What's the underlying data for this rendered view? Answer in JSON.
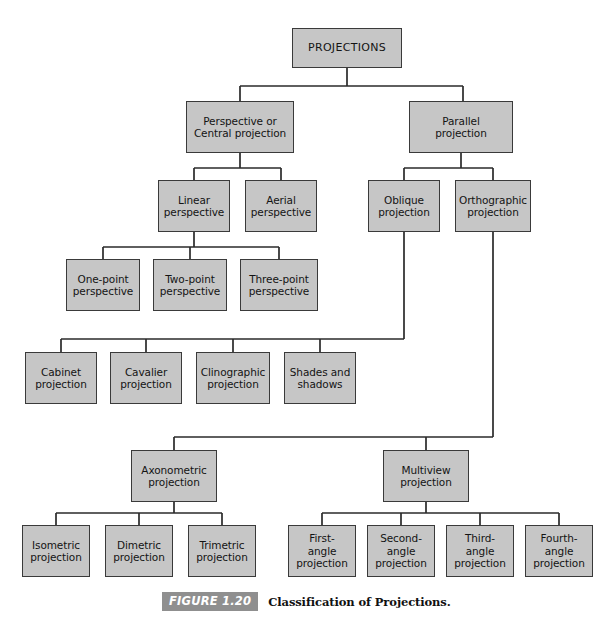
{
  "figure": {
    "label": "FIGURE 1.20",
    "caption": "Classification of Projections."
  },
  "diagram": {
    "type": "tree",
    "title": "Classification of Projections",
    "box_fill_color": "#c6c6c6",
    "box_border_color": "#3a3a3a",
    "line_color": "#2b2b2b",
    "background_color": "#ffffff",
    "levels": 6,
    "nodes": [
      {
        "id": "projections",
        "label": "PROJECTIONS",
        "level": 0,
        "parent": null,
        "x": 292,
        "y": 28,
        "w": 110,
        "h": 40
      },
      {
        "id": "perspective-central",
        "label": "Perspective or\nCentral projection",
        "level": 1,
        "parent": "projections",
        "x": 186,
        "y": 101,
        "w": 108,
        "h": 52
      },
      {
        "id": "parallel",
        "label": "Parallel\nprojection",
        "level": 1,
        "parent": "projections",
        "x": 409,
        "y": 101,
        "w": 104,
        "h": 52
      },
      {
        "id": "linear-perspective",
        "label": "Linear\nperspective",
        "level": 2,
        "parent": "perspective-central",
        "x": 158,
        "y": 180,
        "w": 72,
        "h": 52
      },
      {
        "id": "aerial-perspective",
        "label": "Aerial\nperspective",
        "level": 2,
        "parent": "perspective-central",
        "x": 245,
        "y": 180,
        "w": 72,
        "h": 52
      },
      {
        "id": "oblique",
        "label": "Oblique\nprojection",
        "level": 2,
        "parent": "parallel",
        "x": 368,
        "y": 180,
        "w": 72,
        "h": 52
      },
      {
        "id": "orthographic",
        "label": "Orthographic\nprojection",
        "level": 2,
        "parent": "parallel",
        "x": 455,
        "y": 180,
        "w": 76,
        "h": 52
      },
      {
        "id": "one-point",
        "label": "One-point\nperspective",
        "level": 3,
        "parent": "linear-perspective",
        "x": 66,
        "y": 259,
        "w": 74,
        "h": 52
      },
      {
        "id": "two-point",
        "label": "Two-point\nperspective",
        "level": 3,
        "parent": "linear-perspective",
        "x": 153,
        "y": 259,
        "w": 74,
        "h": 52
      },
      {
        "id": "three-point",
        "label": "Three-point\nperspective",
        "level": 3,
        "parent": "linear-perspective",
        "x": 240,
        "y": 259,
        "w": 78,
        "h": 52
      },
      {
        "id": "cabinet",
        "label": "Cabinet\nprojection",
        "level": 3,
        "parent": "oblique",
        "x": 25,
        "y": 352,
        "w": 72,
        "h": 52
      },
      {
        "id": "cavalier",
        "label": "Cavalier\nprojection",
        "level": 3,
        "parent": "oblique",
        "x": 110,
        "y": 352,
        "w": 72,
        "h": 52
      },
      {
        "id": "clinographic",
        "label": "Clinographic\nprojection",
        "level": 3,
        "parent": "oblique",
        "x": 196,
        "y": 352,
        "w": 74,
        "h": 52
      },
      {
        "id": "shades-shadows",
        "label": "Shades and\nshadows",
        "level": 3,
        "parent": "oblique",
        "x": 284,
        "y": 352,
        "w": 72,
        "h": 52
      },
      {
        "id": "axonometric",
        "label": "Axonometric\nprojection",
        "level": 3,
        "parent": "orthographic",
        "x": 131,
        "y": 450,
        "w": 86,
        "h": 52
      },
      {
        "id": "multiview",
        "label": "Multiview\nprojection",
        "level": 3,
        "parent": "orthographic",
        "x": 383,
        "y": 450,
        "w": 86,
        "h": 52
      },
      {
        "id": "isometric",
        "label": "Isometric\nprojection",
        "level": 4,
        "parent": "axonometric",
        "x": 22,
        "y": 525,
        "w": 68,
        "h": 52
      },
      {
        "id": "dimetric",
        "label": "Dimetric\nprojection",
        "level": 4,
        "parent": "axonometric",
        "x": 105,
        "y": 525,
        "w": 68,
        "h": 52
      },
      {
        "id": "trimetric",
        "label": "Trimetric\nprojection",
        "level": 4,
        "parent": "axonometric",
        "x": 188,
        "y": 525,
        "w": 68,
        "h": 52
      },
      {
        "id": "first-angle",
        "label": "First-\nangle\nprojection",
        "level": 4,
        "parent": "multiview",
        "x": 288,
        "y": 525,
        "w": 68,
        "h": 52
      },
      {
        "id": "second-angle",
        "label": "Second-\nangle\nprojection",
        "level": 4,
        "parent": "multiview",
        "x": 367,
        "y": 525,
        "w": 68,
        "h": 52
      },
      {
        "id": "third-angle",
        "label": "Third-\nangle\nprojection",
        "level": 4,
        "parent": "multiview",
        "x": 446,
        "y": 525,
        "w": 68,
        "h": 52
      },
      {
        "id": "fourth-angle",
        "label": "Fourth-\nangle\nprojection",
        "level": 4,
        "parent": "multiview",
        "x": 525,
        "y": 525,
        "w": 68,
        "h": 52
      }
    ]
  }
}
